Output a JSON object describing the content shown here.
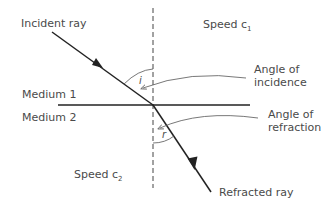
{
  "labels": {
    "incident_ray": "Incident ray",
    "speed_c1": "Speed c",
    "speed_c1_sub": "1",
    "angle_incidence_1": "Angle of",
    "angle_incidence_2": "incidence",
    "medium1": "Medium 1",
    "medium2": "Medium 2",
    "angle_refraction_1": "Angle of",
    "angle_refraction_2": "refraction",
    "speed_c2": "Speed c",
    "speed_c2_sub": "2",
    "refracted_ray": "Refracted ray",
    "angle_i": "i",
    "angle_r": "r"
  },
  "colors": {
    "line": "#222222",
    "text": "#4a4a4a",
    "arrow": "#555555"
  }
}
